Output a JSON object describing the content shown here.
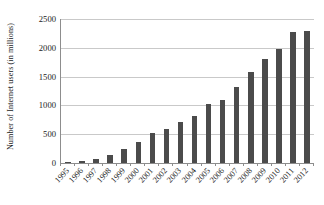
{
  "chart_data": {
    "type": "bar",
    "title": "",
    "subtitle": "",
    "xlabel": "",
    "ylabel": "Number of Internet users (in millions)",
    "categories": [
      "1995",
      "1996",
      "1997",
      "1998",
      "1999",
      "2000",
      "2001",
      "2002",
      "2003",
      "2004",
      "2005",
      "2006",
      "2007",
      "2008",
      "2009",
      "2010",
      "2011",
      "2012"
    ],
    "values": [
      16,
      36,
      70,
      147,
      248,
      361,
      513,
      587,
      719,
      817,
      1018,
      1093,
      1319,
      1574,
      1802,
      1971,
      2267,
      2295
    ],
    "series": [
      {
        "name": "Internet users",
        "values": [
          16,
          36,
          70,
          147,
          248,
          361,
          513,
          587,
          719,
          817,
          1018,
          1093,
          1319,
          1574,
          1802,
          1971,
          2267,
          2295
        ]
      }
    ],
    "ylim": [
      0,
      2500
    ],
    "yticks": [
      0,
      500,
      1000,
      1500,
      2000,
      2500
    ],
    "ytick_labels": [
      "0",
      "500",
      "1000",
      "1500",
      "2000",
      "2500"
    ],
    "grid": "horizontal",
    "legend": "none",
    "bar_color": "#4b4b4b",
    "gridline_color": "#c9c9c9",
    "axis_color": "#8d8d8d",
    "text_color": "#1a1a1a",
    "background_color": "#ffffff",
    "xtick_rotation": -48
  }
}
